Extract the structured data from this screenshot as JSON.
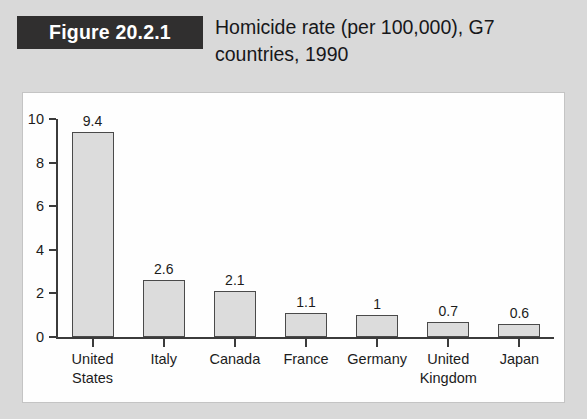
{
  "header": {
    "figure_badge": "Figure 20.2.1",
    "title": "Homicide rate (per 100,000), G7 countries, 1990"
  },
  "colors": {
    "badge_background": "#302f2f",
    "badge_text": "#ffffff",
    "page_background": "#d9d9d9",
    "panel_background": "#fefefe",
    "bar_fill": "#dcdcdc",
    "bar_border": "#4a4a4a",
    "axis": "#3b3b3b",
    "text": "#1c1c1c"
  },
  "chart_data": {
    "type": "bar",
    "title": "Homicide rate (per 100,000), G7 countries, 1990",
    "xlabel": "",
    "ylabel": "",
    "ylim": [
      0,
      10
    ],
    "yticks": [
      0,
      2,
      4,
      6,
      8,
      10
    ],
    "ytick_labels": [
      "0",
      "2",
      "4",
      "6",
      "8",
      "10"
    ],
    "grid": false,
    "legend": false,
    "categories": [
      "United\nStates",
      "Italy",
      "Canada",
      "France",
      "Germany",
      "United\nKingdom",
      "Japan"
    ],
    "values": [
      9.4,
      2.6,
      2.1,
      1.1,
      1,
      0.7,
      0.6
    ],
    "value_labels": [
      "9.4",
      "2.6",
      "2.1",
      "1.1",
      "1",
      "0.7",
      "0.6"
    ]
  }
}
